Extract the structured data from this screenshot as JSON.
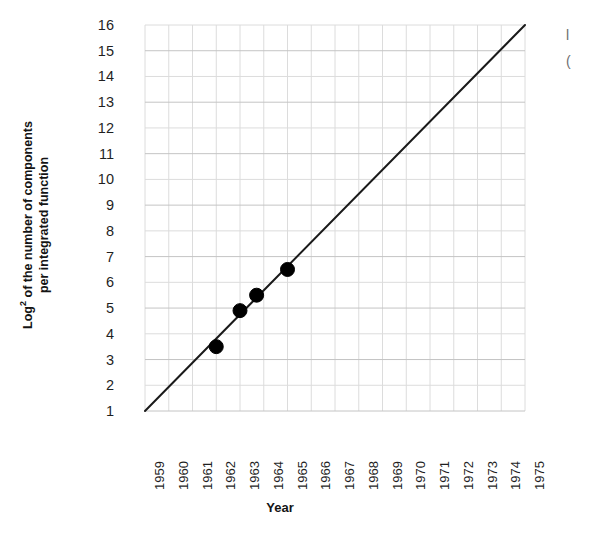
{
  "chart_data": {
    "type": "line",
    "title": "",
    "subtitle": "",
    "xlabel": "Year",
    "ylabel": "Log² of the number of components per integrated function",
    "ylabel_line1": "Log",
    "ylabel_sup": "2",
    "ylabel_line1_rest": " of the number of components",
    "ylabel_line2": "per integrated function",
    "xlim": [
      1959,
      1975
    ],
    "ylim": [
      1,
      16
    ],
    "xticks": [
      1959,
      1960,
      1961,
      1962,
      1963,
      1964,
      1965,
      1966,
      1967,
      1968,
      1969,
      1970,
      1971,
      1972,
      1973,
      1974,
      1975
    ],
    "xtick_labels": [
      "1959",
      "1960",
      "1961",
      "1962",
      "1963",
      "1964",
      "1965",
      "1966",
      "1967",
      "1968",
      "1969",
      "1970",
      "1971",
      "1972",
      "1973",
      "1974",
      "1975"
    ],
    "yticks": [
      1,
      2,
      3,
      4,
      5,
      6,
      7,
      8,
      9,
      10,
      11,
      12,
      13,
      14,
      15,
      16
    ],
    "ytick_labels": [
      "16",
      "15",
      "14",
      "13",
      "12",
      "11",
      "10",
      "9",
      "8",
      "7",
      "6",
      "5",
      "4",
      "3",
      "2",
      "1"
    ],
    "grid": true,
    "grid_color": "#dcdcdc",
    "grid_major_color": "#c4c4c4",
    "legend": "none",
    "line_color": "#1a1a1a",
    "marker_color": "#000000",
    "series": [
      {
        "name": "Log2 components per integrated function",
        "x": [
          1959,
          1975
        ],
        "values": [
          1,
          16
        ],
        "style": "solid",
        "note": "straight trend line spanning the full axis range"
      }
    ],
    "points": [
      {
        "x": 1962.0,
        "y": 3.5
      },
      {
        "x": 1963.0,
        "y": 4.9
      },
      {
        "x": 1963.7,
        "y": 5.5
      },
      {
        "x": 1965.0,
        "y": 6.5
      }
    ],
    "marker_radius_px": 7
  },
  "margin_note": {
    "line1": "l",
    "line2": "("
  }
}
